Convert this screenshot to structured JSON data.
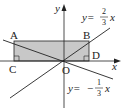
{
  "diagram": {
    "axes": {
      "x_label": "x",
      "y_label": "y",
      "origin_label": "O"
    },
    "points": {
      "A": "A",
      "B": "B",
      "C": "C",
      "D": "D"
    },
    "lines": [
      {
        "name": "line-positive",
        "eq_prefix": "y=",
        "sign": "",
        "num": "2",
        "den": "3",
        "var": "x"
      },
      {
        "name": "line-negative",
        "eq_prefix": "y=",
        "sign": "−",
        "num": "1",
        "den": "3",
        "var": "x"
      }
    ],
    "colors": {
      "rect_fill": "#c8c8c8",
      "stroke": "#222222"
    }
  }
}
